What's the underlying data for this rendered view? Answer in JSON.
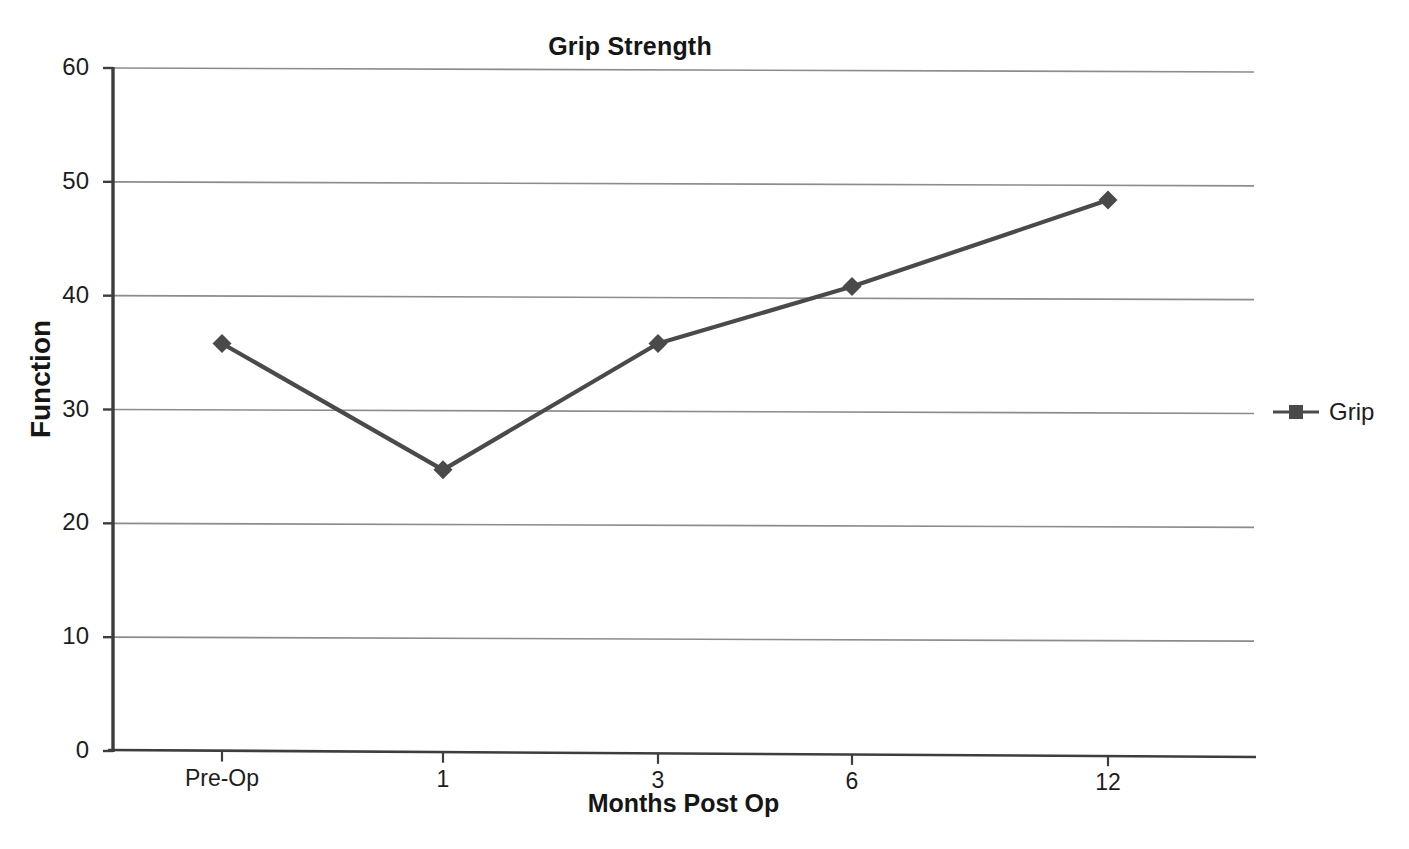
{
  "chart_data": {
    "type": "line",
    "title": "Grip Strength",
    "xlabel": "Months Post Op",
    "ylabel": "Function",
    "categories": [
      "Pre-Op",
      "1",
      "3",
      "6",
      "12"
    ],
    "series": [
      {
        "name": "Grip",
        "values": [
          35.8,
          24.7,
          35.8,
          40.8,
          48.4
        ],
        "color": "#4a4a4a",
        "marker": "diamond"
      }
    ],
    "ylim": [
      0,
      60
    ],
    "yticks": [
      0,
      10,
      20,
      30,
      40,
      50,
      60
    ],
    "ytick_labels": [
      "0",
      "10",
      "20",
      "30",
      "40",
      "50",
      "60"
    ],
    "xtick_labels": [
      "Pre-Op",
      "1",
      "3",
      "6",
      "12"
    ],
    "grid": "horizontal",
    "legend_position": "right",
    "legend_entries": [
      "Grip"
    ],
    "background_color": "#ffffff",
    "gridline_color": "#8c8c8c",
    "axis_color": "#3d3d3d"
  },
  "legend": {
    "grip_label": "Grip"
  },
  "axes": {
    "title": "Grip Strength",
    "y_title": "Function",
    "x_title": "Months Post Op"
  }
}
